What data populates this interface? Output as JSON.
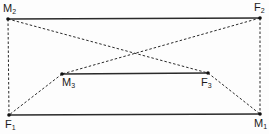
{
  "diagram": {
    "type": "geometric-connection-diagram",
    "colors": {
      "line": "#2a2a2a",
      "point": "#111111"
    },
    "points": [
      {
        "id": "M2",
        "letter": "M",
        "sub": "2",
        "x": 8,
        "y": 19
      },
      {
        "id": "F2",
        "letter": "F",
        "sub": "2",
        "x": 260,
        "y": 18
      },
      {
        "id": "M3",
        "letter": "M",
        "sub": "3",
        "x": 62,
        "y": 74
      },
      {
        "id": "F3",
        "letter": "F",
        "sub": "3",
        "x": 208,
        "y": 73
      },
      {
        "id": "F1",
        "letter": "F",
        "sub": "1",
        "x": 9,
        "y": 115
      },
      {
        "id": "M1",
        "letter": "M",
        "sub": "1",
        "x": 260,
        "y": 114
      }
    ],
    "edges": [
      {
        "from": "M2",
        "to": "F2",
        "style": "solid"
      },
      {
        "from": "F1",
        "to": "M1",
        "style": "solid"
      },
      {
        "from": "M3",
        "to": "F3",
        "style": "solid"
      },
      {
        "from": "M2",
        "to": "F1",
        "style": "dashed"
      },
      {
        "from": "F2",
        "to": "M1",
        "style": "dashed"
      },
      {
        "from": "M2",
        "to": "F3",
        "style": "dashed"
      },
      {
        "from": "F2",
        "to": "M3",
        "style": "dashed"
      },
      {
        "from": "M3",
        "to": "F1",
        "style": "dashed"
      },
      {
        "from": "F3",
        "to": "M1",
        "style": "dashed"
      }
    ],
    "labels": {
      "M2": {
        "letter": "M",
        "sub": "2"
      },
      "F2": {
        "letter": "F",
        "sub": "2"
      },
      "M3": {
        "letter": "M",
        "sub": "3"
      },
      "F3": {
        "letter": "F",
        "sub": "3"
      },
      "F1": {
        "letter": "F",
        "sub": "1"
      },
      "M1": {
        "letter": "M",
        "sub": "1"
      }
    }
  }
}
